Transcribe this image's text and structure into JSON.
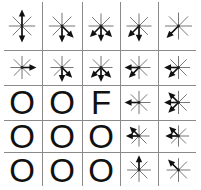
{
  "diagram": {
    "title": "",
    "rows": 5,
    "cols": 5,
    "col_lines_x": [
      42,
      82,
      120,
      158
    ],
    "row_lines_y": [
      50,
      85,
      120,
      152
    ],
    "col_bounds": [
      [
        2,
        42
      ],
      [
        42,
        82
      ],
      [
        82,
        120
      ],
      [
        120,
        158
      ],
      [
        158,
        199
      ]
    ],
    "row_bounds": [
      [
        2,
        50
      ],
      [
        50,
        85
      ],
      [
        85,
        120
      ],
      [
        120,
        152
      ],
      [
        152,
        188
      ]
    ],
    "line_color": "#8a8a8a",
    "star_color": "#777777",
    "arrow_color": "#111111",
    "cells": [
      [
        {
          "type": "star",
          "arrows": [
            "up",
            "down"
          ]
        },
        {
          "type": "star",
          "arrows": [
            "down",
            "down-right"
          ]
        },
        {
          "type": "star",
          "arrows": [
            "down-left",
            "down",
            "down-right"
          ]
        },
        {
          "type": "star",
          "arrows": [
            "down-left",
            "down"
          ]
        },
        {
          "type": "star",
          "arrows": [
            "down-left"
          ]
        }
      ],
      [
        {
          "type": "star",
          "arrows": [
            "right"
          ]
        },
        {
          "type": "star",
          "arrows": [
            "down",
            "down-right"
          ]
        },
        {
          "type": "star",
          "arrows": [
            "down-left",
            "down",
            "down-right"
          ]
        },
        {
          "type": "star",
          "arrows": [
            "left",
            "down-left"
          ]
        },
        {
          "type": "star",
          "arrows": [
            "left",
            "down-left"
          ]
        }
      ],
      [
        {
          "type": "letter",
          "text": "O"
        },
        {
          "type": "letter",
          "text": "O"
        },
        {
          "type": "letter",
          "text": "F"
        },
        {
          "type": "star",
          "arrows": [
            "left"
          ]
        },
        {
          "type": "star",
          "arrows": [
            "left",
            "up-left",
            "down-left"
          ]
        }
      ],
      [
        {
          "type": "letter",
          "text": "O"
        },
        {
          "type": "letter",
          "text": "O"
        },
        {
          "type": "letter",
          "text": "O"
        },
        {
          "type": "star",
          "arrows": [
            "up-left",
            "left"
          ]
        },
        {
          "type": "star",
          "arrows": [
            "left",
            "up-left"
          ]
        }
      ],
      [
        {
          "type": "letter",
          "text": "O"
        },
        {
          "type": "letter",
          "text": "O"
        },
        {
          "type": "letter",
          "text": "O"
        },
        {
          "type": "star",
          "arrows": [
            "up"
          ]
        },
        {
          "type": "star",
          "arrows": [
            "up-left"
          ]
        }
      ]
    ]
  }
}
